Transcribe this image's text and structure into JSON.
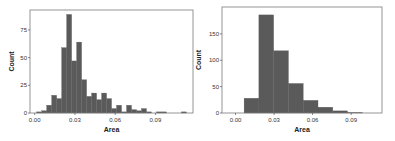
{
  "chart_data": [
    {
      "type": "bar",
      "subtype": "histogram",
      "title": "",
      "xlabel": "Area",
      "ylabel": "Count",
      "xlim": [
        -0.0035,
        0.118
      ],
      "ylim": [
        0,
        93
      ],
      "xticks": [
        0.0,
        0.03,
        0.06,
        0.09
      ],
      "xtick_labels": [
        "0.00",
        "0.03",
        "0.06",
        "0.09"
      ],
      "yticks": [
        0,
        25,
        50,
        75
      ],
      "ytick_labels": [
        "0",
        "25",
        "50",
        "75"
      ],
      "grid": false,
      "legend": null,
      "bin_start": 0.0015,
      "bin_width": 0.00372,
      "values": [
        1,
        2,
        7,
        16,
        13,
        59,
        89,
        47,
        64,
        30,
        15,
        18,
        12,
        18,
        13,
        4,
        7,
        1,
        7,
        3,
        2,
        4,
        1,
        0,
        1,
        1,
        0,
        0,
        0,
        1
      ],
      "bar_color": "#5a5a5a"
    },
    {
      "type": "bar",
      "subtype": "histogram",
      "title": "",
      "xlabel": "Area",
      "ylabel": "Count",
      "xlim": [
        -0.0105,
        0.114
      ],
      "ylim": [
        0,
        201
      ],
      "xticks": [
        0.0,
        0.03,
        0.06,
        0.09
      ],
      "xtick_labels": [
        "0.00",
        "0.03",
        "0.06",
        "0.09"
      ],
      "yticks": [
        0,
        50,
        100,
        150
      ],
      "ytick_labels": [
        "0",
        "50",
        "100",
        "150"
      ],
      "grid": false,
      "legend": null,
      "bin_start": 0.0067,
      "bin_width": 0.0115,
      "values": [
        28,
        186,
        118,
        56,
        24,
        11,
        4,
        1
      ],
      "bar_color": "#5a5a5a"
    }
  ],
  "panels": [
    {
      "box": {
        "x0": 30,
        "y0": 10,
        "x1": 193,
        "y1": 113
      }
    },
    {
      "box": {
        "x0": 222,
        "y0": 7,
        "x1": 382,
        "y1": 113
      }
    }
  ]
}
